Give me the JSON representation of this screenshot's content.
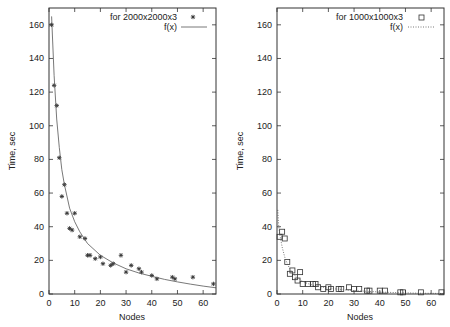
{
  "chart_data": [
    {
      "type": "scatter",
      "panel": "left",
      "title": "",
      "xlabel": "Nodes",
      "ylabel": "Time, sec",
      "xlim": [
        0,
        65
      ],
      "ylim": [
        0,
        170
      ],
      "xticks": [
        0,
        10,
        20,
        30,
        40,
        50,
        60
      ],
      "yticks": [
        0,
        20,
        40,
        60,
        80,
        100,
        120,
        140,
        160
      ],
      "grid": false,
      "legend_position": "top-right",
      "series": [
        {
          "name": "for 2000x2000x3",
          "marker": "asterisk",
          "x": [
            1,
            2,
            3,
            4,
            5,
            6,
            7,
            8,
            9,
            10,
            12,
            14,
            15,
            16,
            18,
            20,
            21,
            24,
            25,
            28,
            30,
            32,
            35,
            36,
            40,
            42,
            48,
            49,
            56,
            64
          ],
          "y": [
            160,
            124,
            112,
            81,
            58,
            65,
            48,
            39,
            38,
            48,
            34,
            33,
            23,
            23,
            21,
            22,
            18,
            17,
            18,
            23,
            13,
            17,
            15,
            13,
            11,
            9,
            10,
            9,
            10,
            6
          ]
        },
        {
          "name": "f(x)",
          "style": "solid-line",
          "x": [
            1,
            2,
            3,
            4,
            5,
            6,
            8,
            10,
            12,
            15,
            20,
            25,
            30,
            35,
            40,
            45,
            50,
            55,
            60,
            65
          ],
          "y": [
            165,
            130,
            104,
            87,
            74,
            65,
            51,
            43,
            37,
            30,
            23,
            18.5,
            15,
            12.5,
            10.5,
            8.7,
            7.2,
            5.9,
            4.7,
            3.7
          ]
        }
      ]
    },
    {
      "type": "scatter",
      "panel": "right",
      "title": "",
      "xlabel": "Nodes",
      "ylabel": "Time, sec",
      "xlim": [
        0,
        65
      ],
      "ylim": [
        0,
        170
      ],
      "xticks": [
        0,
        10,
        20,
        30,
        40,
        50,
        60
      ],
      "yticks": [
        0,
        20,
        40,
        60,
        80,
        100,
        120,
        140,
        160
      ],
      "grid": false,
      "legend_position": "top-right",
      "series": [
        {
          "name": "for 1000x1000x3",
          "marker": "open-square",
          "x": [
            1,
            2,
            3,
            4,
            5,
            6,
            7,
            8,
            9,
            10,
            12,
            14,
            15,
            16,
            18,
            20,
            21,
            24,
            25,
            28,
            30,
            32,
            35,
            36,
            40,
            42,
            48,
            49,
            56,
            64
          ],
          "y": [
            34,
            37,
            33,
            19,
            12,
            14,
            10,
            8,
            13,
            6,
            6,
            6,
            6,
            4,
            3,
            4,
            3,
            3,
            3,
            4,
            3,
            3,
            2,
            2,
            2,
            2,
            1,
            1,
            1,
            1
          ]
        },
        {
          "name": "f(x)",
          "style": "dotted-line",
          "x": [
            0.3,
            0.6,
            1,
            2,
            3,
            4,
            5,
            6,
            8,
            10,
            12,
            15,
            20,
            25,
            30,
            35,
            40,
            45,
            50,
            55,
            60,
            65
          ],
          "y": [
            50,
            42,
            36,
            28,
            22,
            18,
            15,
            12.5,
            9.5,
            7.5,
            6.2,
            4.8,
            3.5,
            2.6,
            2.0,
            1.6,
            1.2,
            0.9,
            0.7,
            0.5,
            0.4,
            0.3
          ]
        }
      ]
    }
  ],
  "labels": {
    "left_xlabel": "Nodes",
    "left_ylabel": "Time, sec",
    "right_xlabel": "Nodes",
    "right_ylabel": "Time, sec",
    "left_legend_data": "for 2000x2000x3",
    "left_legend_fit": "f(x)",
    "right_legend_data": "for 1000x1000x3",
    "right_legend_fit": "f(x)"
  },
  "colors": {
    "frame": "#333333",
    "text": "#222222",
    "marker": "#333333",
    "fit_line": "#555555",
    "background": "#ffffff"
  }
}
